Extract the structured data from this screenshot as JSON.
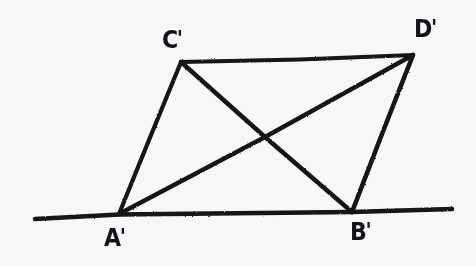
{
  "figure": {
    "background_color": "#f7f6f8",
    "ink_color": "#141317",
    "stroke_width": 4,
    "canvas": {
      "width": 476,
      "height": 266
    },
    "labels": [
      {
        "id": "label-a-prime",
        "text": "A'",
        "letter": "A",
        "prime": "'",
        "x": 104,
        "y": 226
      },
      {
        "id": "label-b-prime",
        "text": "B'",
        "letter": "B",
        "prime": "'",
        "x": 350,
        "y": 220
      },
      {
        "id": "label-c-prime",
        "text": "C'",
        "letter": "C",
        "prime": "'",
        "x": 162,
        "y": 28
      },
      {
        "id": "label-d-prime",
        "text": "D'",
        "letter": "D",
        "prime": "'",
        "x": 414,
        "y": 17
      }
    ],
    "points": {
      "A_prime": {
        "name": "A'",
        "x": 119,
        "y": 214
      },
      "B_prime": {
        "name": "B'",
        "x": 352,
        "y": 212
      },
      "C_prime": {
        "name": "C'",
        "x": 181,
        "y": 62
      },
      "D_prime": {
        "name": "D'",
        "x": 413,
        "y": 55
      },
      "diagonal_intersection": {
        "name": "",
        "x": 265,
        "y": 137
      },
      "baseline_left_end": {
        "name": "",
        "x": 35,
        "y": 219
      },
      "baseline_right_end": {
        "name": "",
        "x": 452,
        "y": 209
      }
    },
    "segments": [
      {
        "id": "segment-baseline",
        "name": "baseline",
        "from": "baseline_left_end",
        "to": "baseline_right_end",
        "d": "M 35 219 L 119 214.5 L 260 213 L 352 212 L 452 209"
      },
      {
        "id": "segment-a-c",
        "name": "A'C'",
        "from": "A_prime",
        "to": "C_prime",
        "d": "M 119 214 L 149 140 L 181 62"
      },
      {
        "id": "segment-c-d",
        "name": "C'D'",
        "from": "C_prime",
        "to": "D_prime",
        "d": "M 181 62 L 300 59.5 L 413 55"
      },
      {
        "id": "segment-d-b",
        "name": "D'B'",
        "from": "D_prime",
        "to": "B_prime",
        "d": "M 413 55 L 382 134 L 352 212"
      },
      {
        "id": "segment-a-d",
        "name": "A'D' (diagonal)",
        "from": "A_prime",
        "to": "D_prime",
        "d": "M 119 214 L 265 137 L 413 55"
      },
      {
        "id": "segment-c-b",
        "name": "C'B' (diagonal)",
        "from": "C_prime",
        "to": "B_prime",
        "d": "M 181 62 L 265 137 L 352 212"
      }
    ]
  }
}
